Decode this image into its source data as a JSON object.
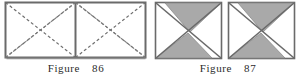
{
  "page": {
    "background_color": "#ffffff",
    "width": 304,
    "height": 76
  },
  "style": {
    "stroke_color": "#555555",
    "stroke_dark": "#3a3a3a",
    "shade_color": "#a9a9a9",
    "fill_white": "#ffffff",
    "caption_color": "#2b2b2b"
  },
  "figures": [
    {
      "id": "figure-86",
      "kind": "geometry-diagram",
      "description": "Rectangle composed of two adjacent squares, divided by a vertical midline, with dashed diagonals of each square and dashed long diagonals of the whole rectangle",
      "caption_word": "Figure",
      "caption_number": "86",
      "caption_full": "Figure 86",
      "shape": "rectangle",
      "aspect_ratio": "2:1",
      "cells": 2,
      "solid_lines": [
        "outer-rectangle-border",
        "vertical-midline"
      ],
      "dashed_lines": [
        "left-square-diagonal-tl-br",
        "left-square-diagonal-bl-tr",
        "right-square-diagonal-tl-br",
        "right-square-diagonal-bl-tr",
        "rectangle-long-diagonal-bl-tr",
        "rectangle-long-diagonal-tl-br"
      ],
      "shaded_regions": 0
    },
    {
      "id": "figure-87",
      "kind": "geometry-diagram",
      "description": "Two identical squares side by side; each square has a shaded top triangle with apex at the centre and a shaded lower-left triangle, with unshaded triangles elsewhere and a diagonal from bottom-left to top-right",
      "caption_word": "Figure",
      "caption_number": "87",
      "caption_full": "Figure 87",
      "shape": "two-squares",
      "squares": [
        {
          "id": "square-1",
          "shaded_triangles": [
            "top-triangle-apex-center",
            "lower-left-triangle"
          ],
          "white_triangles": [
            "left-upper-triangle",
            "right-lower-triangle"
          ],
          "diagonals": [
            "bottom-left-to-top-right",
            "top-left-to-center",
            "center-to-bottom-right"
          ]
        },
        {
          "id": "square-2",
          "shaded_triangles": [
            "top-triangle-apex-center",
            "lower-left-triangle"
          ],
          "white_triangles": [
            "left-upper-triangle",
            "right-lower-triangle"
          ],
          "diagonals": [
            "bottom-left-to-top-right",
            "top-left-to-center",
            "center-to-bottom-right"
          ]
        }
      ],
      "shaded_regions": 4
    }
  ]
}
